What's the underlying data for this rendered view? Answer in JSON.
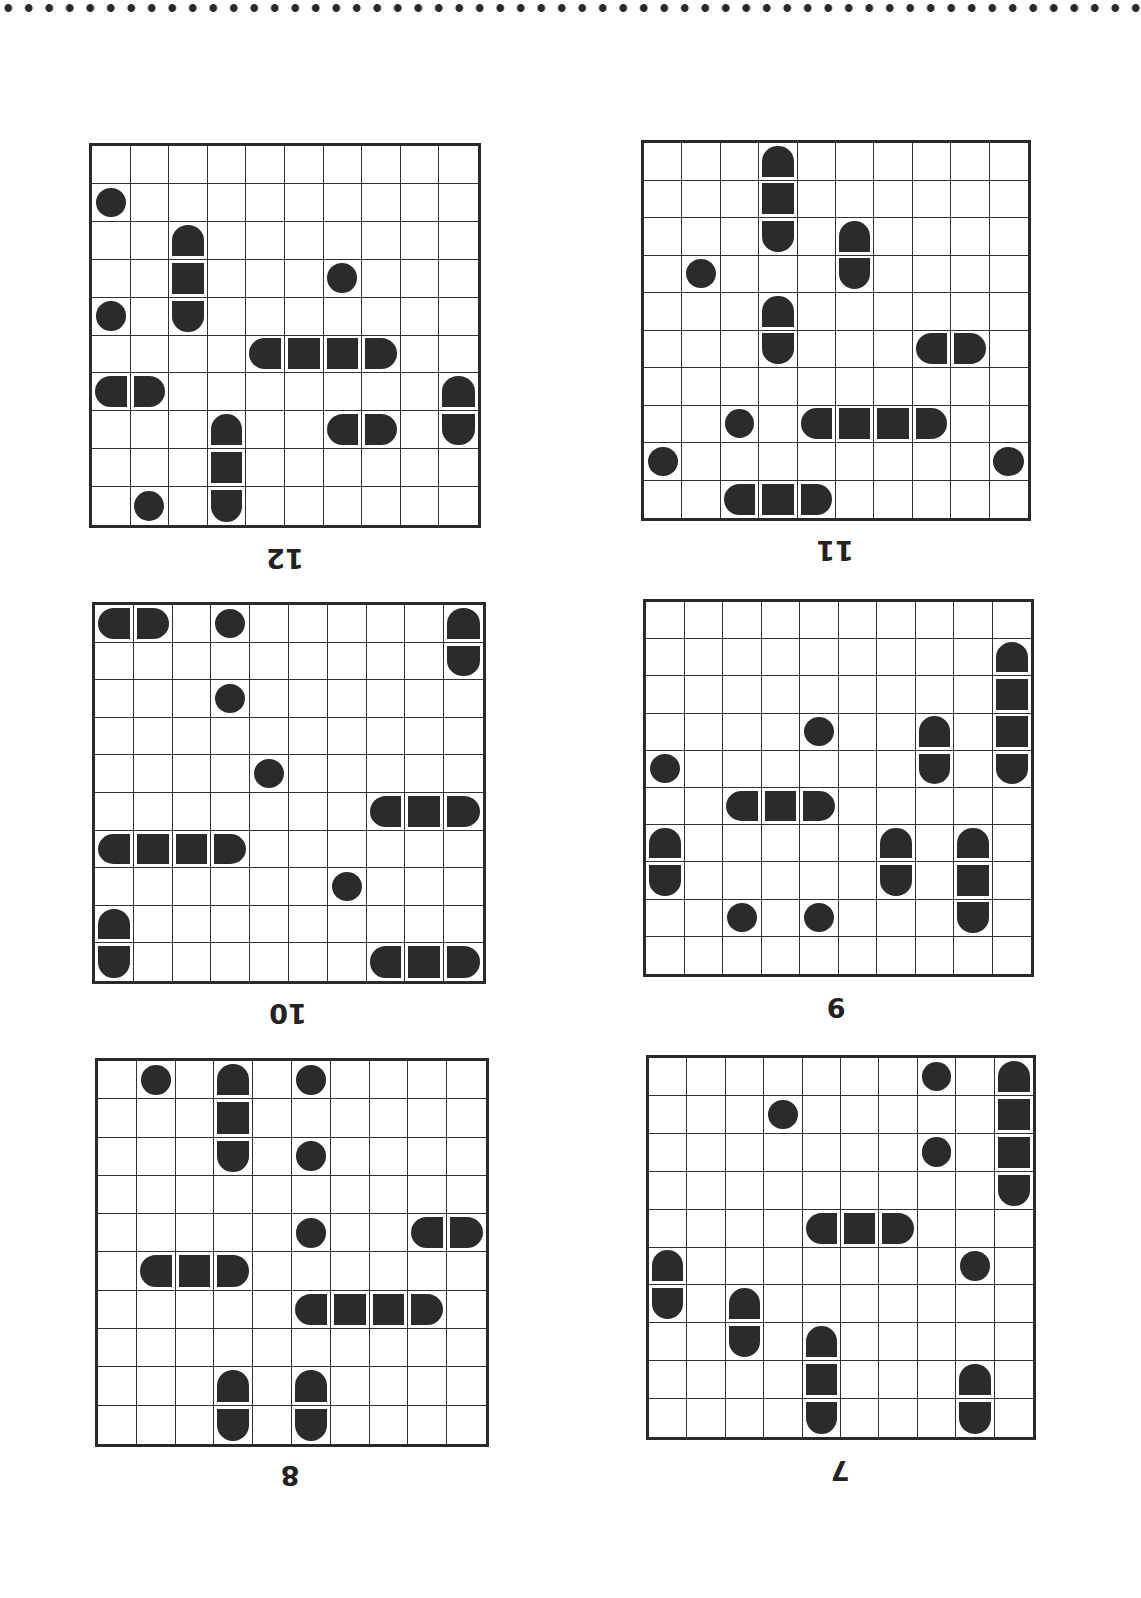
{
  "page": {
    "orientation": "rotated-180",
    "ink_color": "#2b2b2b"
  },
  "puzzles": [
    {
      "number": "12",
      "box": {
        "x": 89,
        "y": 143,
        "w": 392,
        "h": 385
      },
      "label_pos": {
        "x": 245,
        "y": 543
      },
      "pieces": [
        [
          1,
          0,
          "sub"
        ],
        [
          2,
          2,
          "top"
        ],
        [
          3,
          2,
          "mid"
        ],
        [
          4,
          2,
          "bottom"
        ],
        [
          3,
          6,
          "sub"
        ],
        [
          4,
          0,
          "sub"
        ],
        [
          5,
          4,
          "left"
        ],
        [
          5,
          5,
          "mid"
        ],
        [
          5,
          6,
          "mid"
        ],
        [
          5,
          7,
          "right"
        ],
        [
          6,
          0,
          "left"
        ],
        [
          6,
          1,
          "right"
        ],
        [
          6,
          9,
          "top"
        ],
        [
          7,
          9,
          "bottom"
        ],
        [
          7,
          3,
          "top"
        ],
        [
          8,
          3,
          "mid"
        ],
        [
          9,
          3,
          "bottom"
        ],
        [
          7,
          6,
          "left"
        ],
        [
          7,
          7,
          "right"
        ],
        [
          9,
          1,
          "sub"
        ]
      ]
    },
    {
      "number": "11",
      "box": {
        "x": 641,
        "y": 140,
        "w": 390,
        "h": 381
      },
      "label_pos": {
        "x": 795,
        "y": 535
      },
      "pieces": [
        [
          0,
          3,
          "top"
        ],
        [
          1,
          3,
          "mid"
        ],
        [
          2,
          3,
          "bottom"
        ],
        [
          2,
          5,
          "top"
        ],
        [
          3,
          5,
          "bottom"
        ],
        [
          3,
          1,
          "sub"
        ],
        [
          4,
          3,
          "top"
        ],
        [
          5,
          3,
          "bottom"
        ],
        [
          5,
          7,
          "left"
        ],
        [
          5,
          8,
          "right"
        ],
        [
          7,
          2,
          "sub"
        ],
        [
          7,
          4,
          "left"
        ],
        [
          7,
          5,
          "mid"
        ],
        [
          7,
          6,
          "mid"
        ],
        [
          7,
          7,
          "right"
        ],
        [
          8,
          0,
          "sub"
        ],
        [
          8,
          9,
          "sub"
        ],
        [
          9,
          2,
          "left"
        ],
        [
          9,
          3,
          "mid"
        ],
        [
          9,
          4,
          "right"
        ]
      ]
    },
    {
      "number": "10",
      "box": {
        "x": 92,
        "y": 602,
        "w": 394,
        "h": 382
      },
      "label_pos": {
        "x": 248,
        "y": 998
      },
      "pieces": [
        [
          0,
          0,
          "left"
        ],
        [
          0,
          1,
          "right"
        ],
        [
          0,
          3,
          "sub"
        ],
        [
          0,
          9,
          "top"
        ],
        [
          1,
          9,
          "bottom"
        ],
        [
          2,
          3,
          "sub"
        ],
        [
          4,
          4,
          "sub"
        ],
        [
          5,
          7,
          "left"
        ],
        [
          5,
          8,
          "mid"
        ],
        [
          5,
          9,
          "right"
        ],
        [
          6,
          0,
          "left"
        ],
        [
          6,
          1,
          "mid"
        ],
        [
          6,
          2,
          "mid"
        ],
        [
          6,
          3,
          "right"
        ],
        [
          7,
          6,
          "sub"
        ],
        [
          8,
          0,
          "top"
        ],
        [
          9,
          0,
          "bottom"
        ],
        [
          9,
          7,
          "left"
        ],
        [
          9,
          8,
          "mid"
        ],
        [
          9,
          9,
          "right"
        ]
      ]
    },
    {
      "number": "9",
      "box": {
        "x": 643,
        "y": 599,
        "w": 391,
        "h": 378
      },
      "label_pos": {
        "x": 796,
        "y": 992
      },
      "pieces": [
        [
          1,
          9,
          "top"
        ],
        [
          2,
          9,
          "mid"
        ],
        [
          3,
          9,
          "mid"
        ],
        [
          4,
          9,
          "bottom"
        ],
        [
          3,
          4,
          "sub"
        ],
        [
          3,
          7,
          "top"
        ],
        [
          4,
          7,
          "bottom"
        ],
        [
          4,
          0,
          "sub"
        ],
        [
          5,
          2,
          "left"
        ],
        [
          5,
          3,
          "mid"
        ],
        [
          5,
          4,
          "right"
        ],
        [
          6,
          0,
          "top"
        ],
        [
          7,
          0,
          "bottom"
        ],
        [
          6,
          6,
          "top"
        ],
        [
          7,
          6,
          "bottom"
        ],
        [
          6,
          8,
          "top"
        ],
        [
          7,
          8,
          "mid"
        ],
        [
          8,
          8,
          "bottom"
        ],
        [
          8,
          2,
          "sub"
        ],
        [
          8,
          4,
          "sub"
        ]
      ]
    },
    {
      "number": "8",
      "box": {
        "x": 95,
        "y": 1058,
        "w": 394,
        "h": 389
      },
      "label_pos": {
        "x": 250,
        "y": 1460
      },
      "pieces": [
        [
          0,
          1,
          "sub"
        ],
        [
          0,
          3,
          "top"
        ],
        [
          1,
          3,
          "mid"
        ],
        [
          2,
          3,
          "bottom"
        ],
        [
          0,
          5,
          "sub"
        ],
        [
          2,
          5,
          "sub"
        ],
        [
          4,
          5,
          "sub"
        ],
        [
          4,
          8,
          "left"
        ],
        [
          4,
          9,
          "right"
        ],
        [
          5,
          1,
          "left"
        ],
        [
          5,
          2,
          "mid"
        ],
        [
          5,
          3,
          "right"
        ],
        [
          6,
          5,
          "left"
        ],
        [
          6,
          6,
          "mid"
        ],
        [
          6,
          7,
          "mid"
        ],
        [
          6,
          8,
          "right"
        ],
        [
          8,
          3,
          "top"
        ],
        [
          9,
          3,
          "bottom"
        ],
        [
          8,
          5,
          "top"
        ],
        [
          9,
          5,
          "bottom"
        ]
      ]
    },
    {
      "number": "7",
      "box": {
        "x": 646,
        "y": 1055,
        "w": 390,
        "h": 385
      },
      "label_pos": {
        "x": 800,
        "y": 1455
      },
      "pieces": [
        [
          0,
          7,
          "sub"
        ],
        [
          0,
          9,
          "top"
        ],
        [
          1,
          9,
          "mid"
        ],
        [
          2,
          9,
          "mid"
        ],
        [
          3,
          9,
          "bottom"
        ],
        [
          1,
          3,
          "sub"
        ],
        [
          2,
          7,
          "sub"
        ],
        [
          4,
          4,
          "left"
        ],
        [
          4,
          5,
          "mid"
        ],
        [
          4,
          6,
          "right"
        ],
        [
          5,
          0,
          "top"
        ],
        [
          6,
          0,
          "bottom"
        ],
        [
          5,
          8,
          "sub"
        ],
        [
          6,
          2,
          "top"
        ],
        [
          7,
          2,
          "bottom"
        ],
        [
          7,
          4,
          "top"
        ],
        [
          8,
          4,
          "mid"
        ],
        [
          9,
          4,
          "bottom"
        ],
        [
          8,
          8,
          "top"
        ],
        [
          9,
          8,
          "bottom"
        ]
      ]
    }
  ]
}
